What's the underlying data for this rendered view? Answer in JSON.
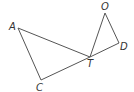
{
  "diagram": {
    "type": "geometry",
    "points": {
      "A": {
        "label": "A",
        "x": 18,
        "y": 28,
        "lx": 9,
        "ly": 30
      },
      "C": {
        "label": "C",
        "x": 41,
        "y": 80,
        "lx": 36,
        "ly": 91
      },
      "T": {
        "label": "T",
        "x": 90,
        "y": 57,
        "lx": 87,
        "ly": 67
      },
      "O": {
        "label": "O",
        "x": 105,
        "y": 13,
        "lx": 101,
        "ly": 10
      },
      "D": {
        "label": "D",
        "x": 119,
        "y": 43,
        "lx": 120,
        "ly": 50
      }
    },
    "segments": [
      [
        "A",
        "C"
      ],
      [
        "A",
        "T"
      ],
      [
        "C",
        "T"
      ],
      [
        "T",
        "D"
      ],
      [
        "O",
        "T"
      ],
      [
        "O",
        "D"
      ]
    ]
  }
}
